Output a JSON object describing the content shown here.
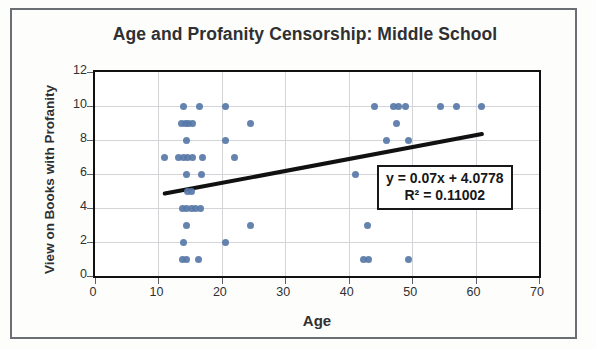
{
  "chart_data": {
    "type": "scatter",
    "title": "Age and Profanity Censorship: Middle School",
    "xlabel": "Age",
    "ylabel": "View on Books with Profanity",
    "xlim": [
      0,
      70
    ],
    "ylim": [
      0,
      12
    ],
    "xticks": [
      0,
      10,
      20,
      30,
      40,
      50,
      60,
      70
    ],
    "yticks": [
      0,
      2,
      4,
      6,
      8,
      10,
      12
    ],
    "grid": true,
    "legend": false,
    "marker_color": "#5878a8",
    "trendline_color": "#111111",
    "series": [
      {
        "name": "Respondents",
        "points": [
          [
            14,
            10
          ],
          [
            16.5,
            10
          ],
          [
            20.5,
            10
          ],
          [
            44,
            10
          ],
          [
            47,
            10
          ],
          [
            47.8,
            10
          ],
          [
            49,
            10
          ],
          [
            54.5,
            10
          ],
          [
            57,
            10
          ],
          [
            61,
            10
          ],
          [
            13.6,
            9
          ],
          [
            14.2,
            9
          ],
          [
            14.8,
            9
          ],
          [
            15.4,
            9
          ],
          [
            24.5,
            9
          ],
          [
            47.5,
            9
          ],
          [
            14.5,
            8
          ],
          [
            20.5,
            8
          ],
          [
            46,
            8
          ],
          [
            49.5,
            8
          ],
          [
            11,
            7
          ],
          [
            13.2,
            7
          ],
          [
            13.9,
            7
          ],
          [
            14.6,
            7
          ],
          [
            15.3,
            7
          ],
          [
            17,
            7
          ],
          [
            22,
            7
          ],
          [
            14.5,
            6
          ],
          [
            16.8,
            6
          ],
          [
            41,
            6
          ],
          [
            14.6,
            5
          ],
          [
            15.2,
            5
          ],
          [
            13.8,
            4
          ],
          [
            14.5,
            4
          ],
          [
            15.2,
            4
          ],
          [
            15.9,
            4
          ],
          [
            16.6,
            4
          ],
          [
            14.5,
            3
          ],
          [
            24.5,
            3
          ],
          [
            43,
            3
          ],
          [
            14,
            2
          ],
          [
            20.5,
            2
          ],
          [
            13.8,
            1
          ],
          [
            14.4,
            1
          ],
          [
            16.3,
            1
          ],
          [
            42.3,
            1
          ],
          [
            43.1,
            1
          ],
          [
            49.5,
            1
          ]
        ]
      }
    ],
    "trendline": {
      "equation": "y = 0.07x + 4.0778",
      "r_squared_label": "R² = 0.11002",
      "slope": 0.07,
      "intercept": 4.0778,
      "r_squared": 0.11002,
      "x_start": 11,
      "x_end": 61
    }
  },
  "axes": {
    "y_tick_labels": [
      "12",
      "10",
      "8",
      "6",
      "4",
      "2",
      "0"
    ],
    "x_tick_labels": [
      "0",
      "10",
      "20",
      "30",
      "40",
      "50",
      "60",
      "70"
    ]
  },
  "equation_box": {
    "line1": "y = 0.07x + 4.0778",
    "line2": "R² = 0.11002"
  }
}
